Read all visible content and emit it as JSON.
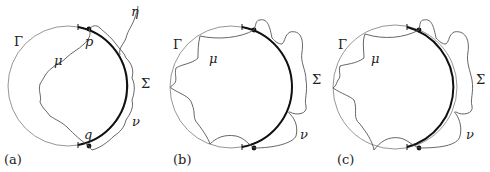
{
  "figure": {
    "panels": [
      {
        "id": "a",
        "label": "(a)",
        "circle_label": "Γ",
        "inner_curve_label": "μ",
        "outer_curve_label": "ν",
        "arc_label": "Σ",
        "extra_curve_label": "η",
        "point_top_label": "p",
        "point_bottom_label": "q"
      },
      {
        "id": "b",
        "label": "(b)",
        "circle_label": "Γ",
        "inner_curve_label": "μ",
        "outer_curve_label": "ν",
        "arc_label": "Σ"
      },
      {
        "id": "c",
        "label": "(c)",
        "circle_label": "Γ",
        "inner_curve_label": "μ",
        "outer_curve_label": "ν",
        "arc_label": "Σ"
      }
    ],
    "colors": {
      "thin_line": "#8a8a8a",
      "curve_line": "#555555",
      "thick_arc": "#111111",
      "text": "#222222"
    }
  }
}
